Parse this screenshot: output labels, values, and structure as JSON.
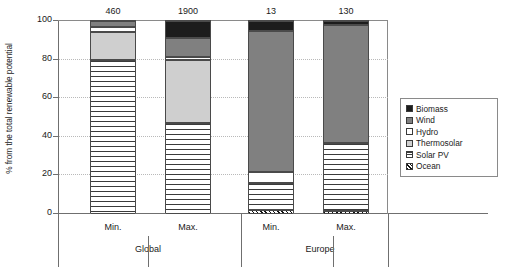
{
  "chart_data": {
    "type": "bar",
    "subtype": "stacked-column",
    "title": "",
    "xlabel": "",
    "ylabel": "% from the total renewable potential",
    "ylim": [
      0,
      100
    ],
    "yticks": [
      0,
      20,
      40,
      60,
      80,
      100
    ],
    "grid": "horizontal-dotted",
    "legend_position": "right",
    "categories": [
      "Min.",
      "Max.",
      "Min.",
      "Max."
    ],
    "groups": [
      {
        "name": "Global",
        "categories": [
          "Min.",
          "Max."
        ]
      },
      {
        "name": "Europe",
        "categories": [
          "Min.",
          "Max."
        ]
      }
    ],
    "bar_value_labels": [
      "460",
      "1900",
      "13",
      "130"
    ],
    "series": [
      {
        "name": "Biomass",
        "color": "#1c1c1c",
        "pattern": "solid",
        "values": [
          0.0,
          9.0,
          5.0,
          2.0
        ]
      },
      {
        "name": "Wind",
        "color": "#808080",
        "pattern": "solid",
        "values": [
          3.0,
          9.5,
          73.0,
          61.0
        ]
      },
      {
        "name": "Hydro",
        "color": "#ffffff",
        "pattern": "solid",
        "values": [
          2.5,
          1.5,
          6.0,
          0.0
        ]
      },
      {
        "name": "Thermosolar",
        "color": "#cfcfcf",
        "pattern": "solid",
        "values": [
          14.5,
          33.0,
          0.0,
          0.0
        ]
      },
      {
        "name": "Solar PV",
        "color": "#ffffff",
        "pattern": "horizontal-lines",
        "values": [
          80.0,
          47.0,
          14.0,
          35.5
        ]
      },
      {
        "name": "Ocean",
        "color": "#999999",
        "pattern": "crosshatch",
        "values": [
          0.0,
          0.0,
          2.0,
          1.5
        ]
      }
    ],
    "stacks": [
      {
        "label": "Min.",
        "group": "Global",
        "value_label": "460",
        "segments": [
          {
            "series": "Solar PV",
            "from": 0.0,
            "to": 80.0
          },
          {
            "series": "Thermosolar",
            "from": 80.0,
            "to": 94.5
          },
          {
            "series": "Hydro",
            "from": 94.5,
            "to": 97.0
          },
          {
            "series": "Wind",
            "from": 97.0,
            "to": 100.0
          }
        ]
      },
      {
        "label": "Max.",
        "group": "Global",
        "value_label": "1900",
        "segments": [
          {
            "series": "Solar PV",
            "from": 0.0,
            "to": 47.0
          },
          {
            "series": "Thermosolar",
            "from": 47.0,
            "to": 80.0
          },
          {
            "series": "Hydro",
            "from": 80.0,
            "to": 81.5
          },
          {
            "series": "Wind",
            "from": 81.5,
            "to": 91.0
          },
          {
            "series": "Biomass",
            "from": 91.0,
            "to": 100.0
          }
        ]
      },
      {
        "label": "Min.",
        "group": "Europe",
        "value_label": "13",
        "segments": [
          {
            "series": "Ocean",
            "from": 0.0,
            "to": 2.0
          },
          {
            "series": "Solar PV",
            "from": 2.0,
            "to": 16.0
          },
          {
            "series": "Hydro",
            "from": 16.0,
            "to": 22.0
          },
          {
            "series": "Wind",
            "from": 22.0,
            "to": 95.0
          },
          {
            "series": "Biomass",
            "from": 95.0,
            "to": 100.0
          }
        ]
      },
      {
        "label": "Max.",
        "group": "Europe",
        "value_label": "130",
        "segments": [
          {
            "series": "Ocean",
            "from": 0.0,
            "to": 1.5
          },
          {
            "series": "Solar PV",
            "from": 1.5,
            "to": 37.0
          },
          {
            "series": "Wind",
            "from": 37.0,
            "to": 98.0
          },
          {
            "series": "Biomass",
            "from": 98.0,
            "to": 100.0
          }
        ]
      }
    ],
    "legend": [
      {
        "label": "Biomass",
        "key": "biomass"
      },
      {
        "label": "Wind",
        "key": "wind"
      },
      {
        "label": "Hydro",
        "key": "hydro"
      },
      {
        "label": "Thermosolar",
        "key": "thermosolar"
      },
      {
        "label": "Solar PV",
        "key": "solarpv"
      },
      {
        "label": "Ocean",
        "key": "ocean"
      }
    ]
  }
}
